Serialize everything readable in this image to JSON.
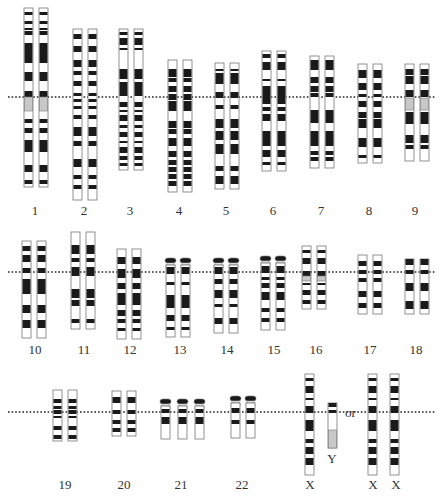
{
  "colors": {
    "band_dark": "#1a1a1a",
    "band_light": "#ffffff",
    "band_gray": "#c8c8c8",
    "outline": "#777777",
    "centromere_line": "#222222",
    "label": "#333333"
  },
  "rows": [
    {
      "centromere_y": 97,
      "label_y": 204
    },
    {
      "centromere_y": 272,
      "label_y": 343
    },
    {
      "centromere_y": 412,
      "label_y": 478
    }
  ],
  "or_label": {
    "text": "or",
    "x": 345,
    "y": 416
  },
  "chromosomes": [
    {
      "id": "1",
      "label": "1",
      "row": 0,
      "xs": [
        24,
        39
      ],
      "top": 8,
      "bottom": 187,
      "label_x": 35,
      "bands": [
        [
          12,
          15,
          "d"
        ],
        [
          21,
          24,
          "d"
        ],
        [
          28,
          30,
          "d"
        ],
        [
          31,
          35,
          "d"
        ],
        [
          43,
          63,
          "d"
        ],
        [
          72,
          81,
          "d"
        ],
        [
          91,
          97,
          "d"
        ],
        [
          97,
          111,
          "g"
        ],
        [
          119,
          123,
          "d"
        ],
        [
          128,
          133,
          "d"
        ],
        [
          140,
          152,
          "d"
        ],
        [
          165,
          172,
          "d"
        ],
        [
          180,
          184,
          "d"
        ]
      ]
    },
    {
      "id": "2",
      "label": "2",
      "row": 0,
      "xs": [
        73,
        88
      ],
      "top": 29,
      "bottom": 200,
      "label_x": 84,
      "bands": [
        [
          34,
          39,
          "d"
        ],
        [
          46,
          52,
          "d"
        ],
        [
          60,
          67,
          "d"
        ],
        [
          71,
          75,
          "d"
        ],
        [
          81,
          86,
          "d"
        ],
        [
          93,
          96,
          "d"
        ],
        [
          99,
          102,
          "d"
        ],
        [
          106,
          109,
          "d"
        ],
        [
          115,
          119,
          "d"
        ],
        [
          127,
          136,
          "d"
        ],
        [
          141,
          146,
          "d"
        ],
        [
          159,
          167,
          "d"
        ],
        [
          175,
          179,
          "d"
        ],
        [
          185,
          189,
          "d"
        ]
      ]
    },
    {
      "id": "3",
      "label": "3",
      "row": 0,
      "xs": [
        119,
        134
      ],
      "top": 29,
      "bottom": 170,
      "label_x": 130,
      "bands": [
        [
          32,
          35,
          "d"
        ],
        [
          38,
          45,
          "d"
        ],
        [
          48,
          50,
          "d"
        ],
        [
          69,
          79,
          "d"
        ],
        [
          82,
          96,
          "d"
        ],
        [
          102,
          107,
          "d"
        ],
        [
          110,
          112,
          "d"
        ],
        [
          115,
          121,
          "d"
        ],
        [
          125,
          128,
          "d"
        ],
        [
          132,
          137,
          "d"
        ],
        [
          141,
          143,
          "d"
        ],
        [
          147,
          153,
          "d"
        ],
        [
          156,
          160,
          "d"
        ],
        [
          163,
          166,
          "d"
        ]
      ]
    },
    {
      "id": "4",
      "label": "4",
      "row": 0,
      "xs": [
        168,
        183
      ],
      "top": 60,
      "bottom": 192,
      "label_x": 179,
      "bands": [
        [
          69,
          77,
          "d"
        ],
        [
          78,
          82,
          "d"
        ],
        [
          86,
          92,
          "d"
        ],
        [
          94,
          100,
          "d"
        ],
        [
          101,
          111,
          "d"
        ],
        [
          121,
          128,
          "d"
        ],
        [
          129,
          134,
          "d"
        ],
        [
          138,
          146,
          "d"
        ],
        [
          151,
          157,
          "d"
        ],
        [
          160,
          165,
          "d"
        ],
        [
          167,
          172,
          "d"
        ],
        [
          174,
          179,
          "d"
        ],
        [
          181,
          186,
          "d"
        ]
      ]
    },
    {
      "id": "5",
      "label": "5",
      "row": 0,
      "xs": [
        215,
        230
      ],
      "top": 63,
      "bottom": 189,
      "label_x": 226,
      "bands": [
        [
          69,
          71,
          "d"
        ],
        [
          73,
          84,
          "d"
        ],
        [
          92,
          98,
          "d"
        ],
        [
          105,
          109,
          "d"
        ],
        [
          119,
          128,
          "d"
        ],
        [
          131,
          140,
          "d"
        ],
        [
          144,
          154,
          "d"
        ],
        [
          166,
          171,
          "d"
        ],
        [
          176,
          184,
          "d"
        ]
      ]
    },
    {
      "id": "6",
      "label": "6",
      "row": 0,
      "xs": [
        262,
        277
      ],
      "top": 51,
      "bottom": 171,
      "label_x": 273,
      "bands": [
        [
          54,
          58,
          "d"
        ],
        [
          62,
          70,
          "d"
        ],
        [
          79,
          81,
          "d"
        ],
        [
          86,
          104,
          "d"
        ],
        [
          107,
          111,
          "d"
        ],
        [
          114,
          121,
          "d"
        ],
        [
          131,
          146,
          "d"
        ],
        [
          150,
          157,
          "d"
        ],
        [
          162,
          165,
          "d"
        ]
      ]
    },
    {
      "id": "7",
      "label": "7",
      "row": 0,
      "xs": [
        310,
        325
      ],
      "top": 56,
      "bottom": 168,
      "label_x": 321,
      "bands": [
        [
          60,
          70,
          "d"
        ],
        [
          77,
          83,
          "d"
        ],
        [
          86,
          92,
          "d"
        ],
        [
          93,
          97,
          "d"
        ],
        [
          110,
          123,
          "d"
        ],
        [
          131,
          146,
          "d"
        ],
        [
          151,
          155,
          "d"
        ],
        [
          157,
          161,
          "d"
        ]
      ]
    },
    {
      "id": "8",
      "label": "8",
      "row": 0,
      "xs": [
        358,
        373
      ],
      "top": 64,
      "bottom": 163,
      "label_x": 369,
      "bands": [
        [
          70,
          78,
          "d"
        ],
        [
          83,
          90,
          "d"
        ],
        [
          94,
          97,
          "d"
        ],
        [
          101,
          107,
          "d"
        ],
        [
          112,
          118,
          "d"
        ],
        [
          119,
          128,
          "d"
        ],
        [
          138,
          147,
          "d"
        ],
        [
          155,
          158,
          "d"
        ]
      ]
    },
    {
      "id": "9",
      "label": "9",
      "row": 0,
      "xs": [
        405,
        420
      ],
      "top": 64,
      "bottom": 161,
      "label_x": 415,
      "bands": [
        [
          69,
          75,
          "d"
        ],
        [
          76,
          84,
          "d"
        ],
        [
          90,
          97,
          "d"
        ],
        [
          98,
          110,
          "g"
        ],
        [
          112,
          124,
          "d"
        ],
        [
          135,
          143,
          "d"
        ],
        [
          145,
          149,
          "d"
        ]
      ]
    },
    {
      "id": "10",
      "label": "10",
      "row": 1,
      "xs": [
        22,
        37
      ],
      "top": 241,
      "bottom": 338,
      "label_x": 35,
      "bands": [
        [
          246,
          251,
          "d"
        ],
        [
          255,
          262,
          "d"
        ],
        [
          268,
          273,
          "d"
        ],
        [
          279,
          294,
          "d"
        ],
        [
          305,
          313,
          "d"
        ],
        [
          320,
          328,
          "d"
        ]
      ]
    },
    {
      "id": "11",
      "label": "11",
      "row": 1,
      "xs": [
        71,
        86
      ],
      "top": 232,
      "bottom": 329,
      "label_x": 84,
      "bands": [
        [
          245,
          254,
          "d"
        ],
        [
          258,
          262,
          "d"
        ],
        [
          267,
          276,
          "d"
        ],
        [
          289,
          298,
          "d"
        ],
        [
          300,
          306,
          "d"
        ],
        [
          319,
          323,
          "d"
        ]
      ]
    },
    {
      "id": "12",
      "label": "12",
      "row": 1,
      "xs": [
        117,
        132
      ],
      "top": 249,
      "bottom": 339,
      "label_x": 130,
      "bands": [
        [
          257,
          264,
          "d"
        ],
        [
          269,
          278,
          "d"
        ],
        [
          283,
          289,
          "d"
        ],
        [
          293,
          305,
          "d"
        ],
        [
          310,
          316,
          "d"
        ],
        [
          319,
          323,
          "d"
        ],
        [
          328,
          331,
          "d"
        ]
      ]
    },
    {
      "id": "13",
      "label": "13",
      "row": 1,
      "xs": [
        166,
        181
      ],
      "top": 258,
      "bottom": 337,
      "label_x": 180,
      "satellite": true,
      "bands": [
        [
          267,
          274,
          "d"
        ],
        [
          282,
          285,
          "d"
        ],
        [
          295,
          308,
          "d"
        ],
        [
          315,
          321,
          "d"
        ],
        [
          327,
          330,
          "d"
        ]
      ]
    },
    {
      "id": "14",
      "label": "14",
      "row": 1,
      "xs": [
        214,
        229
      ],
      "top": 258,
      "bottom": 333,
      "label_x": 227,
      "satellite": true,
      "bands": [
        [
          267,
          274,
          "d"
        ],
        [
          279,
          284,
          "d"
        ],
        [
          290,
          298,
          "d"
        ],
        [
          304,
          307,
          "d"
        ],
        [
          318,
          324,
          "d"
        ]
      ]
    },
    {
      "id": "15",
      "label": "15",
      "row": 1,
      "xs": [
        261,
        276
      ],
      "top": 256,
      "bottom": 330,
      "label_x": 274,
      "satellite": true,
      "bands": [
        [
          266,
          273,
          "d"
        ],
        [
          277,
          280,
          "d"
        ],
        [
          283,
          288,
          "d"
        ],
        [
          292,
          300,
          "d"
        ],
        [
          308,
          312,
          "d"
        ],
        [
          318,
          322,
          "d"
        ]
      ]
    },
    {
      "id": "16",
      "label": "16",
      "row": 1,
      "xs": [
        302,
        317
      ],
      "top": 246,
      "bottom": 309,
      "label_x": 316,
      "bands": [
        [
          250,
          253,
          "d"
        ],
        [
          258,
          264,
          "d"
        ],
        [
          271,
          276,
          "d"
        ],
        [
          276,
          281,
          "g"
        ],
        [
          283,
          285,
          "d"
        ],
        [
          290,
          295,
          "d"
        ],
        [
          300,
          304,
          "d"
        ]
      ]
    },
    {
      "id": "17",
      "label": "17",
      "row": 1,
      "xs": [
        358,
        373
      ],
      "top": 255,
      "bottom": 314,
      "label_x": 370,
      "bands": [
        [
          261,
          266,
          "d"
        ],
        [
          270,
          274,
          "d"
        ],
        [
          278,
          282,
          "d"
        ],
        [
          291,
          297,
          "d"
        ],
        [
          303,
          308,
          "d"
        ]
      ]
    },
    {
      "id": "18",
      "label": "18",
      "row": 1,
      "xs": [
        405,
        420
      ],
      "top": 259,
      "bottom": 314,
      "label_x": 416,
      "bands": [
        [
          259,
          265,
          "d"
        ],
        [
          270,
          274,
          "d"
        ],
        [
          283,
          291,
          "d"
        ],
        [
          301,
          309,
          "d"
        ]
      ]
    },
    {
      "id": "19",
      "label": "19",
      "row": 2,
      "xs": [
        53,
        68
      ],
      "top": 390,
      "bottom": 441,
      "label_x": 65,
      "bands": [
        [
          399,
          403,
          "d"
        ],
        [
          406,
          409,
          "d"
        ],
        [
          410,
          414,
          "d"
        ],
        [
          416,
          418,
          "d"
        ],
        [
          426,
          430,
          "d"
        ],
        [
          435,
          439,
          "d"
        ]
      ]
    },
    {
      "id": "20",
      "label": "20",
      "row": 2,
      "xs": [
        112,
        127
      ],
      "top": 391,
      "bottom": 436,
      "label_x": 124,
      "bands": [
        [
          397,
          403,
          "d"
        ],
        [
          410,
          414,
          "d"
        ],
        [
          420,
          424,
          "d"
        ],
        [
          428,
          432,
          "d"
        ]
      ]
    },
    {
      "id": "21",
      "label": "21",
      "row": 2,
      "xs": [
        161,
        178,
        195
      ],
      "top": 399,
      "bottom": 439,
      "label_x": 181,
      "satellite": true,
      "bands": [
        [
          409,
          413,
          "d"
        ],
        [
          417,
          424,
          "d"
        ]
      ]
    },
    {
      "id": "22",
      "label": "22",
      "row": 2,
      "xs": [
        231,
        246
      ],
      "top": 396,
      "bottom": 438,
      "label_x": 242,
      "satellite": true,
      "bands": [
        [
          408,
          413,
          "d"
        ],
        [
          420,
          424,
          "d"
        ]
      ]
    },
    {
      "id": "X-male",
      "label": "X",
      "row": 2,
      "xs": [
        305
      ],
      "top": 374,
      "bottom": 475,
      "label_x": 310,
      "bands": [
        [
          378,
          381,
          "d"
        ],
        [
          386,
          393,
          "d"
        ],
        [
          398,
          400,
          "d"
        ],
        [
          406,
          413,
          "d"
        ],
        [
          420,
          431,
          "d"
        ],
        [
          439,
          443,
          "d"
        ],
        [
          447,
          454,
          "d"
        ],
        [
          458,
          465,
          "d"
        ]
      ]
    },
    {
      "id": "Y",
      "label": "Y",
      "row": 2,
      "xs": [
        328
      ],
      "top": 403,
      "bottom": 448,
      "label_x": 332,
      "bands": [
        [
          403,
          407,
          "d"
        ],
        [
          410,
          413,
          "d"
        ],
        [
          430,
          448,
          "g"
        ]
      ]
    },
    {
      "id": "X-female-1",
      "label": "X",
      "row": 2,
      "xs": [
        368
      ],
      "top": 374,
      "bottom": 475,
      "label_x": 373,
      "bands": [
        [
          378,
          381,
          "d"
        ],
        [
          386,
          393,
          "d"
        ],
        [
          398,
          400,
          "d"
        ],
        [
          406,
          413,
          "d"
        ],
        [
          420,
          431,
          "d"
        ],
        [
          439,
          443,
          "d"
        ],
        [
          447,
          454,
          "d"
        ],
        [
          458,
          465,
          "d"
        ]
      ]
    },
    {
      "id": "X-female-2",
      "label": "X",
      "row": 2,
      "xs": [
        390
      ],
      "top": 374,
      "bottom": 475,
      "label_x": 396,
      "bands": [
        [
          378,
          381,
          "d"
        ],
        [
          386,
          393,
          "d"
        ],
        [
          398,
          400,
          "d"
        ],
        [
          406,
          413,
          "d"
        ],
        [
          420,
          431,
          "d"
        ],
        [
          439,
          443,
          "d"
        ],
        [
          447,
          454,
          "d"
        ],
        [
          458,
          465,
          "d"
        ]
      ]
    }
  ]
}
